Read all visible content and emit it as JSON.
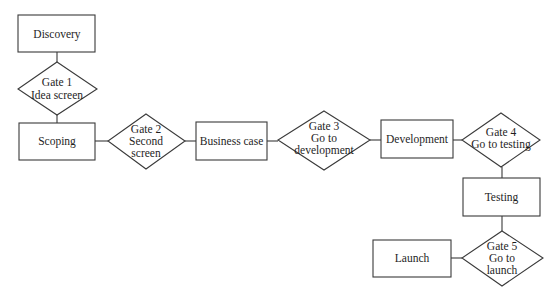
{
  "diagram": {
    "type": "stage-gate process flowchart",
    "stages": [
      {
        "id": "discovery",
        "label": "Discovery"
      },
      {
        "id": "scoping",
        "label": "Scoping"
      },
      {
        "id": "business_case",
        "label": "Business case"
      },
      {
        "id": "development",
        "label": "Development"
      },
      {
        "id": "testing",
        "label": "Testing"
      },
      {
        "id": "launch",
        "label": "Launch"
      }
    ],
    "gates": [
      {
        "id": "gate1",
        "lines": [
          "Gate 1",
          "Idea screen"
        ]
      },
      {
        "id": "gate2",
        "lines": [
          "Gate 2",
          "Second",
          "screen"
        ]
      },
      {
        "id": "gate3",
        "lines": [
          "Gate 3",
          "Go to",
          "development"
        ]
      },
      {
        "id": "gate4",
        "lines": [
          "Gate 4",
          "Go to testing"
        ]
      },
      {
        "id": "gate5",
        "lines": [
          "Gate 5",
          "Go to",
          "launch"
        ]
      }
    ],
    "flow": [
      "discovery",
      "gate1",
      "scoping",
      "gate2",
      "business_case",
      "gate3",
      "development",
      "gate4",
      "testing",
      "gate5",
      "launch"
    ]
  },
  "colors": {
    "background": "#ffffff",
    "stroke": "#3a3a3a",
    "text": "#1e1e1e"
  }
}
